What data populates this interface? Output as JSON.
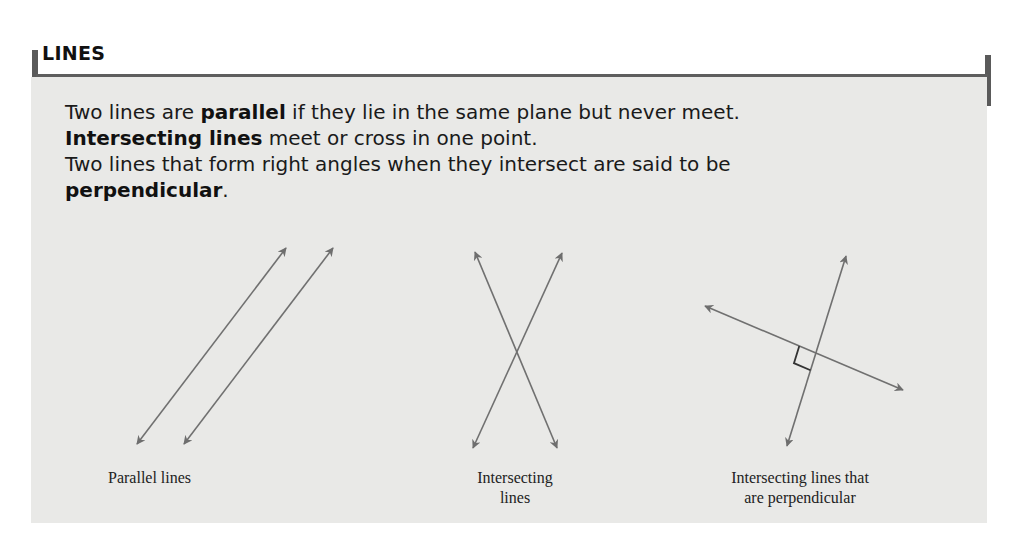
{
  "section": {
    "title": "LINES"
  },
  "definitions": {
    "line1": {
      "pre": "Two lines are ",
      "term": "parallel",
      "post": " if they lie in the same plane but never meet."
    },
    "line2": {
      "term": "Intersecting lines",
      "post": " meet or cross in one point."
    },
    "line3": {
      "text": "Two lines that form right angles when they intersect are said to be"
    },
    "line4": {
      "term": "perpendicular",
      "post": "."
    }
  },
  "figures": [
    {
      "id": "parallel",
      "caption": "Parallel lines",
      "lines": [
        {
          "x1": 137,
          "y1": 444,
          "x2": 286,
          "y2": 248
        },
        {
          "x1": 184,
          "y1": 444,
          "x2": 333,
          "y2": 248
        }
      ]
    },
    {
      "id": "intersecting",
      "caption_line1": "Intersecting",
      "caption_line2": "lines",
      "lines": [
        {
          "x1": 475,
          "y1": 252,
          "x2": 557,
          "y2": 448
        },
        {
          "x1": 473,
          "y1": 448,
          "x2": 562,
          "y2": 253
        }
      ]
    },
    {
      "id": "perpendicular",
      "caption_line1": "Intersecting lines that",
      "caption_line2": "are perpendicular",
      "lines": [
        {
          "x1": 705,
          "y1": 306,
          "x2": 903,
          "y2": 390
        },
        {
          "x1": 787,
          "y1": 446,
          "x2": 846,
          "y2": 256
        }
      ],
      "right_angle_marker": true
    }
  ],
  "colors": {
    "panel_bg": "#e9e9e7",
    "rule": "#5e5e5e",
    "line_stroke": "#707070",
    "text": "#1a1a1a"
  }
}
